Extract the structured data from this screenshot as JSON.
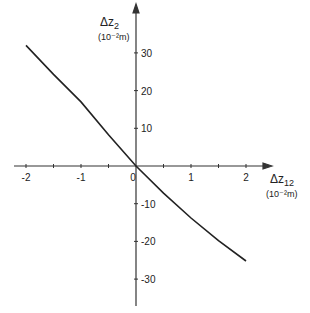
{
  "chart_data": {
    "type": "line",
    "title": "",
    "xlabel": "Δz12 (10^-2 m)",
    "ylabel": "Δz2 (10^-2 m)",
    "xlabel_main": "Δz",
    "xlabel_sub": "12",
    "xlabel_unit": "(10⁻²m)",
    "ylabel_main": "Δz",
    "ylabel_sub": "2",
    "ylabel_unit": "(10⁻²m)",
    "xlim": [
      -2.2,
      2.4
    ],
    "ylim": [
      -35,
      38
    ],
    "x_ticks": [
      -2,
      -1.5,
      -1,
      -0.5,
      0,
      0.5,
      1,
      1.5,
      2
    ],
    "x_tick_labels": [
      {
        "v": -2,
        "t": "-2"
      },
      {
        "v": -1,
        "t": "-1"
      },
      {
        "v": 0,
        "t": "0"
      },
      {
        "v": 1,
        "t": "1"
      },
      {
        "v": 2,
        "t": "2"
      }
    ],
    "y_tick_labels": [
      {
        "v": 30,
        "t": "30"
      },
      {
        "v": 20,
        "t": "20"
      },
      {
        "v": 10,
        "t": "10"
      },
      {
        "v": -10,
        "t": "-10"
      },
      {
        "v": -20,
        "t": "-20"
      },
      {
        "v": -30,
        "t": "-30"
      }
    ],
    "grid": false,
    "legend": null,
    "series": [
      {
        "name": "Δz2 vs Δz12",
        "x": [
          -2,
          -1.5,
          -1,
          -0.5,
          0,
          0.5,
          1,
          1.5,
          2
        ],
        "y": [
          32,
          24.3,
          17,
          8.3,
          0,
          -7.2,
          -13.8,
          -19.8,
          -25.2
        ]
      }
    ]
  }
}
